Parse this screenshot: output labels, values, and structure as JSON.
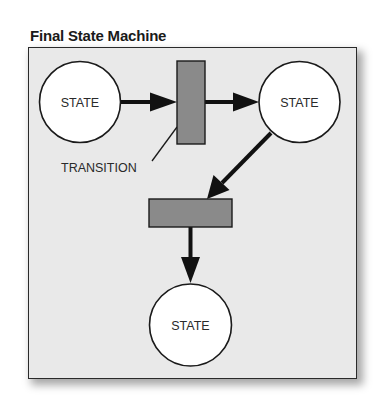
{
  "title": "Final State Machine",
  "colors": {
    "background": "#e9e9e9",
    "state_fill": "#ffffff",
    "transition_fill": "#8a8a8a",
    "stroke": "#1a1a1a"
  },
  "states": [
    {
      "id": "state-left",
      "label": "STATE"
    },
    {
      "id": "state-right",
      "label": "STATE"
    },
    {
      "id": "state-bottom",
      "label": "STATE"
    }
  ],
  "transitions": [
    {
      "id": "transition-vertical",
      "orientation": "vertical"
    },
    {
      "id": "transition-horizontal",
      "orientation": "horizontal"
    }
  ],
  "callout": {
    "label": "TRANSITION",
    "target": "transition-vertical"
  },
  "edges": [
    {
      "from": "state-left",
      "to": "transition-vertical"
    },
    {
      "from": "transition-vertical",
      "to": "state-right"
    },
    {
      "from": "state-right",
      "to": "transition-horizontal"
    },
    {
      "from": "transition-horizontal",
      "to": "state-bottom"
    }
  ]
}
